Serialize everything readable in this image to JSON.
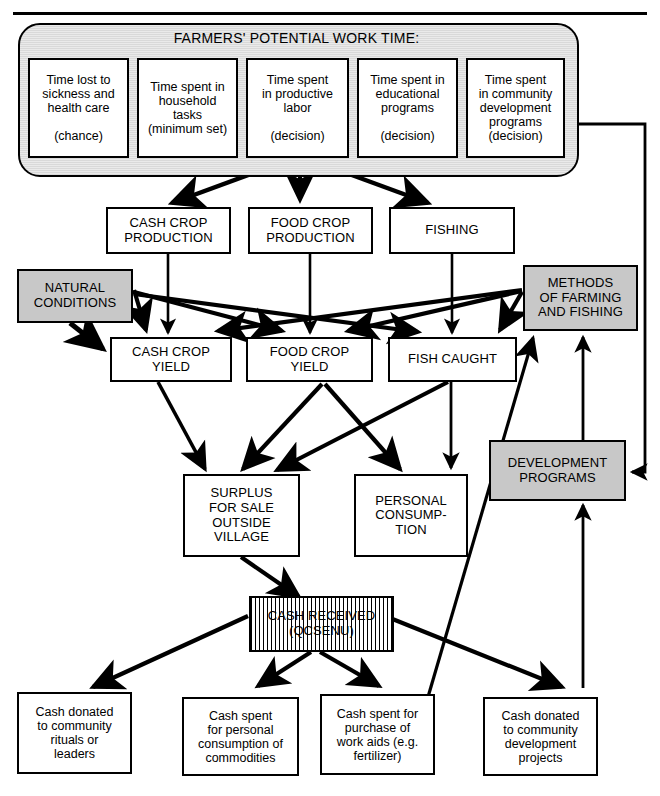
{
  "diagram": {
    "title": "FARMERS' POTENTIAL WORK TIME:",
    "type": "flowchart",
    "legend": {
      "shaded_meaning": "shaded-box",
      "hatched_meaning": "hatched-box",
      "plain_meaning": "plain-box"
    },
    "top_group": {
      "label": "FARMERS' POTENTIAL WORK TIME:",
      "items": [
        {
          "id": "time-sickness",
          "lines": [
            "Time lost to",
            "sickness and",
            "health care",
            "",
            "(chance)"
          ],
          "kind": "chance"
        },
        {
          "id": "time-household",
          "lines": [
            "Time spent in",
            "household",
            "tasks",
            "(minimum set)"
          ],
          "kind": "minimum set"
        },
        {
          "id": "time-productive",
          "lines": [
            "Time spent",
            "in productive",
            "labor",
            "",
            "(decision)"
          ],
          "kind": "decision"
        },
        {
          "id": "time-educational",
          "lines": [
            "Time spent in",
            "educational",
            "programs",
            "",
            "(decision)"
          ],
          "kind": "decision"
        },
        {
          "id": "time-community",
          "lines": [
            "Time spent",
            "in community",
            "development",
            "programs",
            "(decision)"
          ],
          "kind": "decision"
        }
      ]
    },
    "nodes": [
      {
        "id": "cash-crop-production",
        "lines": [
          "CASH CROP",
          "PRODUCTION"
        ],
        "style": "plain"
      },
      {
        "id": "food-crop-production",
        "lines": [
          "FOOD CROP",
          "PRODUCTION"
        ],
        "style": "plain"
      },
      {
        "id": "fishing",
        "lines": [
          "FISHING"
        ],
        "style": "plain"
      },
      {
        "id": "natural-conditions",
        "lines": [
          "NATURAL",
          "CONDITIONS"
        ],
        "style": "shaded"
      },
      {
        "id": "methods-of-farming",
        "lines": [
          "METHODS",
          "OF FARMING",
          "AND FISHING"
        ],
        "style": "shaded"
      },
      {
        "id": "cash-crop-yield",
        "lines": [
          "CASH CROP",
          "YIELD"
        ],
        "style": "plain"
      },
      {
        "id": "food-crop-yield",
        "lines": [
          "FOOD CROP",
          "YIELD"
        ],
        "style": "plain"
      },
      {
        "id": "fish-caught",
        "lines": [
          "FISH  CAUGHT"
        ],
        "style": "plain"
      },
      {
        "id": "surplus-for-sale",
        "lines": [
          "SURPLUS",
          "FOR SALE",
          "OUTSIDE",
          "VILLAGE"
        ],
        "style": "plain"
      },
      {
        "id": "personal-consumption",
        "lines": [
          "PERSONAL",
          "CONSUMP-",
          "TION"
        ],
        "style": "plain"
      },
      {
        "id": "development-programs",
        "lines": [
          "DEVELOPMENT",
          "PROGRAMS"
        ],
        "style": "shaded"
      },
      {
        "id": "cash-received",
        "lines": [
          "CASH RECEIVED",
          "(QCSENU)"
        ],
        "style": "hatched"
      },
      {
        "id": "cash-rituals",
        "lines": [
          "Cash donated",
          "to community",
          "rituals or",
          "leaders"
        ],
        "style": "plain"
      },
      {
        "id": "cash-personal-consumption",
        "lines": [
          "Cash spent",
          "for personal",
          "consumption of",
          "commodities"
        ],
        "style": "plain"
      },
      {
        "id": "cash-work-aids",
        "lines": [
          "Cash spent for",
          "purchase of",
          "work aids (e.g.",
          "fertilizer)"
        ],
        "style": "plain"
      },
      {
        "id": "cash-development",
        "lines": [
          "Cash donated",
          "to community",
          "development",
          "projects"
        ],
        "style": "plain"
      }
    ],
    "edges": [
      {
        "from": "time-productive",
        "to": "cash-crop-production"
      },
      {
        "from": "time-productive",
        "to": "food-crop-production"
      },
      {
        "from": "time-productive",
        "to": "fishing"
      },
      {
        "from": "cash-crop-production",
        "to": "cash-crop-yield"
      },
      {
        "from": "food-crop-production",
        "to": "food-crop-yield"
      },
      {
        "from": "fishing",
        "to": "fish-caught"
      },
      {
        "from": "natural-conditions",
        "to": "cash-crop-yield"
      },
      {
        "from": "natural-conditions",
        "to": "food-crop-yield"
      },
      {
        "from": "natural-conditions",
        "to": "fish-caught"
      },
      {
        "from": "methods-of-farming",
        "to": "cash-crop-yield"
      },
      {
        "from": "methods-of-farming",
        "to": "food-crop-yield"
      },
      {
        "from": "methods-of-farming",
        "to": "fish-caught"
      },
      {
        "from": "cash-crop-yield",
        "to": "surplus-for-sale"
      },
      {
        "from": "food-crop-yield",
        "to": "surplus-for-sale"
      },
      {
        "from": "food-crop-yield",
        "to": "personal-consumption"
      },
      {
        "from": "fish-caught",
        "to": "surplus-for-sale"
      },
      {
        "from": "fish-caught",
        "to": "personal-consumption"
      },
      {
        "from": "surplus-for-sale",
        "to": "cash-received"
      },
      {
        "from": "cash-received",
        "to": "cash-rituals"
      },
      {
        "from": "cash-received",
        "to": "cash-personal-consumption"
      },
      {
        "from": "cash-received",
        "to": "cash-work-aids"
      },
      {
        "from": "cash-received",
        "to": "cash-development"
      },
      {
        "from": "cash-work-aids",
        "to": "methods-of-farming"
      },
      {
        "from": "cash-development",
        "to": "development-programs"
      },
      {
        "from": "development-programs",
        "to": "methods-of-farming"
      },
      {
        "from": "time-community",
        "to": "development-programs"
      }
    ]
  }
}
